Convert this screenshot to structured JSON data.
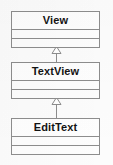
{
  "diagram": {
    "type": "uml-class-diagram",
    "background_color": "#fcfcfc",
    "line_color": "#8d8d8d",
    "text_color": "#131313",
    "classes": [
      {
        "name": "View",
        "compartments": [
          "",
          ""
        ],
        "x": 11,
        "y": 11,
        "width": 89,
        "height": 35
      },
      {
        "name": "TextView",
        "compartments": [
          "",
          ""
        ],
        "x": 11,
        "y": 62,
        "width": 89,
        "height": 35
      },
      {
        "name": "EditText",
        "compartments": [
          "",
          ""
        ],
        "x": 11,
        "y": 118,
        "width": 89,
        "height": 35
      }
    ],
    "relationships": [
      {
        "type": "generalization",
        "label": "inheritance-arrow-textview-to-view",
        "from": "TextView",
        "to": "View",
        "arrow": "hollow-triangle"
      },
      {
        "type": "generalization",
        "label": "inheritance-arrow-edittext-to-textview",
        "from": "EditText",
        "to": "TextView",
        "arrow": "hollow-triangle"
      }
    ]
  }
}
